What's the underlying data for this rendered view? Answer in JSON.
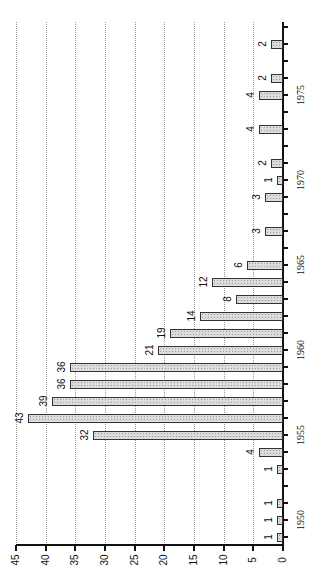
{
  "chart_data": {
    "type": "bar",
    "orientation": "rotated-90 (vertical bar chart printed sideways; years run bottom-to-top along right axis, values increase leftward)",
    "title": "",
    "xlabel": "",
    "ylabel": "",
    "categories": [
      1949,
      1950,
      1951,
      1952,
      1953,
      1954,
      1955,
      1956,
      1957,
      1958,
      1959,
      1960,
      1961,
      1962,
      1963,
      1964,
      1965,
      1966,
      1967,
      1968,
      1969,
      1970,
      1971,
      1972,
      1973,
      1974,
      1975,
      1976,
      1977,
      1978,
      1979
    ],
    "values": [
      1,
      1,
      1,
      0,
      1,
      4,
      32,
      43,
      39,
      36,
      36,
      21,
      19,
      14,
      8,
      12,
      6,
      0,
      3,
      0,
      3,
      1,
      2,
      0,
      4,
      0,
      4,
      2,
      0,
      2,
      0
    ],
    "data_labels_shown": true,
    "year_tick_labels": [
      "1950",
      "1955",
      "1960",
      "1965",
      "1970",
      "1975"
    ],
    "value_tick_labels": [
      "0",
      "5",
      "10",
      "15",
      "20",
      "25",
      "30",
      "35",
      "40",
      "45"
    ],
    "ylim": [
      0,
      45
    ],
    "grid": "dotted lines at every 5 units",
    "legend": null
  },
  "axis": {
    "value_ticks": [
      0,
      5,
      10,
      15,
      20,
      25,
      30,
      35,
      40,
      45
    ],
    "year_labels": [
      1950,
      1955,
      1960,
      1965,
      1970,
      1975
    ]
  }
}
